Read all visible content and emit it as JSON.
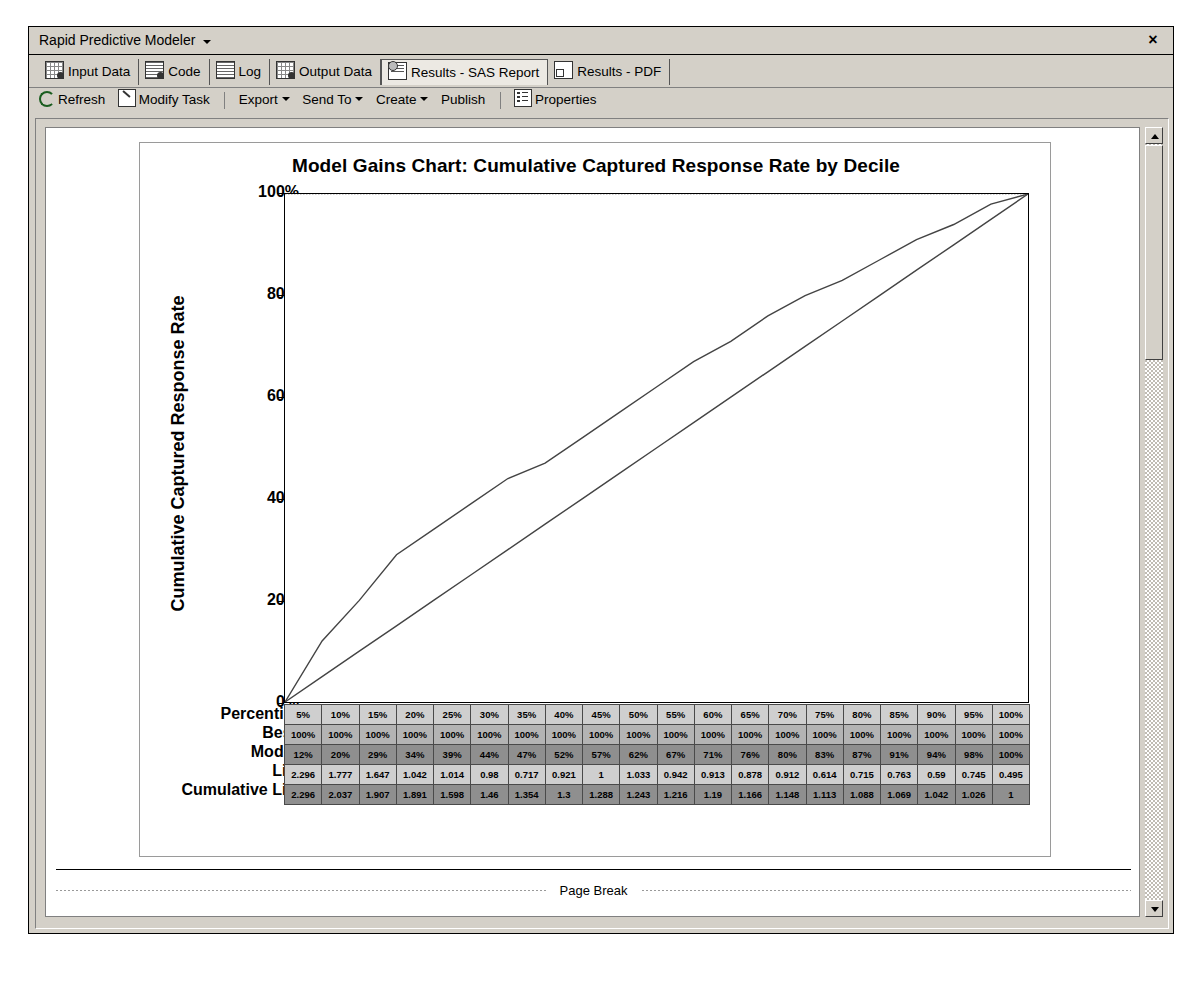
{
  "window": {
    "title": "Rapid Predictive Modeler",
    "close_label": "×"
  },
  "tabs": [
    {
      "label": "Input Data",
      "icon": "grid-data-icon",
      "active": false
    },
    {
      "label": "Code",
      "icon": "code-doc-icon",
      "active": false
    },
    {
      "label": "Log",
      "icon": "log-doc-icon",
      "active": false
    },
    {
      "label": "Output Data",
      "icon": "grid-data-icon",
      "active": false
    },
    {
      "label": "Results - SAS Report",
      "icon": "report-icon",
      "active": true
    },
    {
      "label": "Results - PDF",
      "icon": "pdf-icon",
      "active": false
    }
  ],
  "toolbar": {
    "refresh_label": "Refresh",
    "modify_label": "Modify Task",
    "export_label": "Export",
    "sendto_label": "Send To",
    "create_label": "Create",
    "publish_label": "Publish",
    "properties_label": "Properties"
  },
  "footer": {
    "page_break_label": "Page Break"
  },
  "chart_data": {
    "type": "line",
    "title": "Model Gains Chart:  Cumulative Captured Response Rate by Decile",
    "xlabel": "",
    "ylabel": "Cumulative Captured Response Rate",
    "ylim": [
      0,
      100
    ],
    "ytick_labels": [
      "0%",
      "20%",
      "40%",
      "60%",
      "80%",
      "100%"
    ],
    "ytick_values": [
      0,
      20,
      40,
      60,
      80,
      100
    ],
    "grid": false,
    "legend": "none",
    "categories": [
      "5%",
      "10%",
      "15%",
      "20%",
      "25%",
      "30%",
      "35%",
      "40%",
      "45%",
      "50%",
      "55%",
      "60%",
      "65%",
      "70%",
      "75%",
      "80%",
      "85%",
      "90%",
      "95%",
      "100%"
    ],
    "series": [
      {
        "name": "Best",
        "values": [
          100,
          100,
          100,
          100,
          100,
          100,
          100,
          100,
          100,
          100,
          100,
          100,
          100,
          100,
          100,
          100,
          100,
          100,
          100,
          100
        ]
      },
      {
        "name": "Model",
        "values": [
          12,
          20,
          29,
          34,
          39,
          44,
          47,
          52,
          57,
          62,
          67,
          71,
          76,
          80,
          83,
          87,
          91,
          94,
          98,
          100
        ]
      },
      {
        "name": "Baseline",
        "values": [
          5,
          10,
          15,
          20,
          25,
          30,
          35,
          40,
          45,
          50,
          55,
          60,
          65,
          70,
          75,
          80,
          85,
          90,
          95,
          100
        ]
      }
    ],
    "table": {
      "row_labels": [
        "Percentile",
        "Best",
        "Model",
        "Lift",
        "Cumulative Lift"
      ],
      "rows": [
        [
          "5%",
          "10%",
          "15%",
          "20%",
          "25%",
          "30%",
          "35%",
          "40%",
          "45%",
          "50%",
          "55%",
          "60%",
          "65%",
          "70%",
          "75%",
          "80%",
          "85%",
          "90%",
          "95%",
          "100%"
        ],
        [
          "100%",
          "100%",
          "100%",
          "100%",
          "100%",
          "100%",
          "100%",
          "100%",
          "100%",
          "100%",
          "100%",
          "100%",
          "100%",
          "100%",
          "100%",
          "100%",
          "100%",
          "100%",
          "100%",
          "100%"
        ],
        [
          "12%",
          "20%",
          "29%",
          "34%",
          "39%",
          "44%",
          "47%",
          "52%",
          "57%",
          "62%",
          "67%",
          "71%",
          "76%",
          "80%",
          "83%",
          "87%",
          "91%",
          "94%",
          "98%",
          "100%"
        ],
        [
          "2.296",
          "1.777",
          "1.647",
          "1.042",
          "1.014",
          "0.98",
          "0.717",
          "0.921",
          "1",
          "1.033",
          "0.942",
          "0.913",
          "0.878",
          "0.912",
          "0.614",
          "0.715",
          "0.763",
          "0.59",
          "0.745",
          "0.495"
        ],
        [
          "2.296",
          "2.037",
          "1.907",
          "1.891",
          "1.598",
          "1.46",
          "1.354",
          "1.3",
          "1.288",
          "1.243",
          "1.216",
          "1.19",
          "1.166",
          "1.148",
          "1.113",
          "1.088",
          "1.069",
          "1.042",
          "1.026",
          "1"
        ]
      ]
    }
  }
}
